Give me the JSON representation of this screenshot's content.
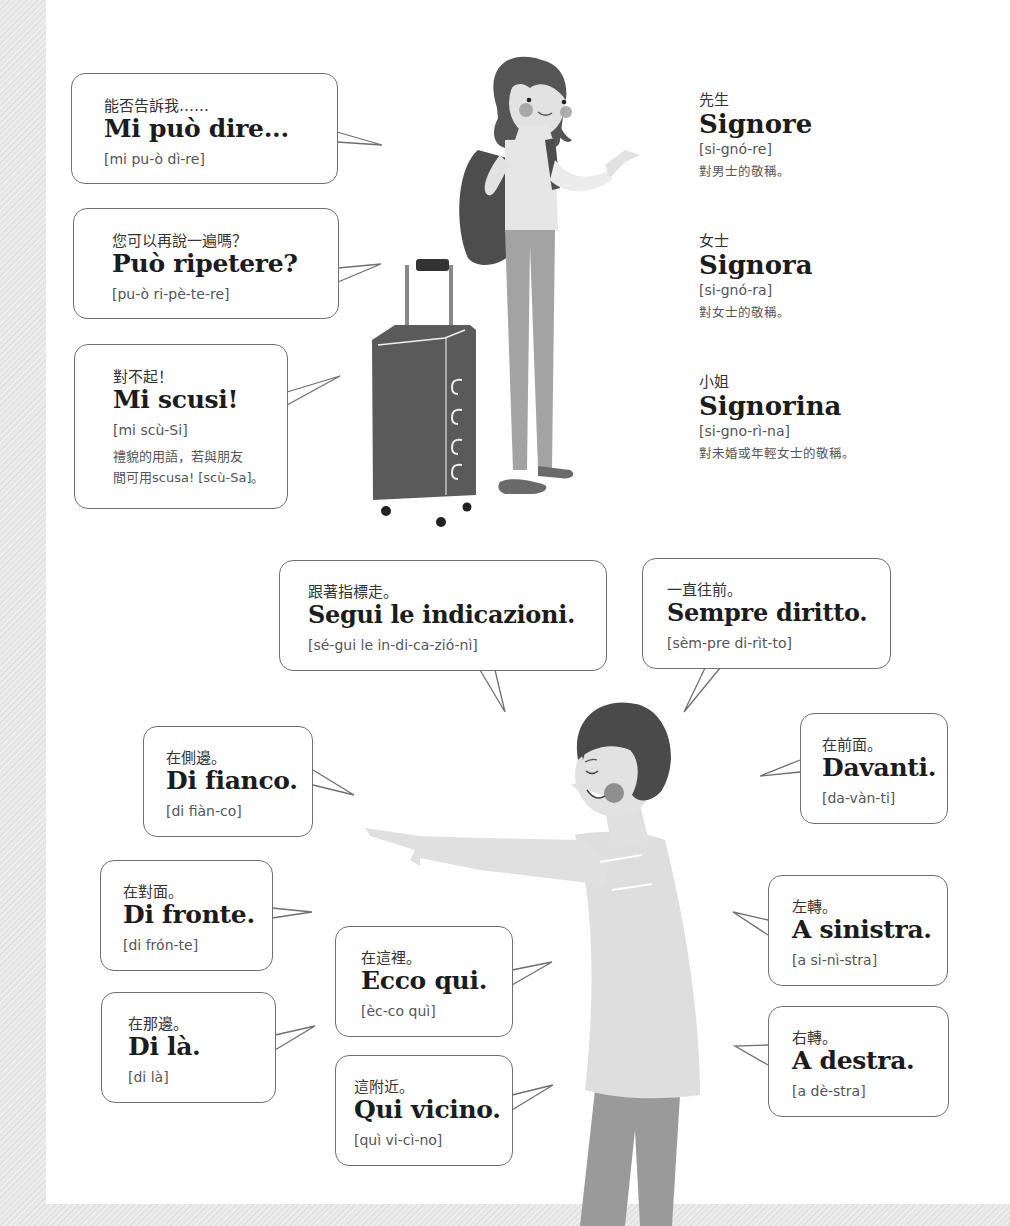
{
  "colors": {
    "background_stripe": "#e6e6e6",
    "page": "#ffffff",
    "bubble_border": "#6f6f6f",
    "text_dark": "#1c1c1c",
    "text_muted": "#555555",
    "hair_dark": "#4a4a4a",
    "skin": "#dcdcdc",
    "pants": "#9a9a9a",
    "cheek": "#8a8a8a"
  },
  "top_bubbles": [
    {
      "zh": "能否告訴我……",
      "it": "Mi può dire...",
      "pron": "[mi pu-ò dì-re]"
    },
    {
      "zh": "您可以再說一遍嗎？",
      "it": "Può ripetere?",
      "pron": "[pu-ò ri-pè-te-re]"
    },
    {
      "zh": "對不起！",
      "it": "Mi scusi!",
      "pron": "[mi scù-Si]",
      "note1": "禮貌的用語，若與朋友",
      "note2": "間可用scusa! [scù-Sa]。"
    }
  ],
  "titles": [
    {
      "zh": "先生",
      "it": "Signore",
      "pron": "[si-gnó-re]",
      "note": "對男士的敬稱。"
    },
    {
      "zh": "女士",
      "it": "Signora",
      "pron": "[si-gnó-ra]",
      "note": "對女士的敬稱。"
    },
    {
      "zh": "小姐",
      "it": "Signorina",
      "pron": "[si-gno-rì-na]",
      "note": "對未婚或年輕女士的敬稱。"
    }
  ],
  "directions": {
    "segui": {
      "zh": "跟著指標走。",
      "it": "Segui le indicazioni.",
      "pron": "[sé-gui le in-di-ca-zió-nì]"
    },
    "sempre": {
      "zh": "一直往前。",
      "it": "Sempre diritto.",
      "pron": "[sèm-pre di-rìt-to]"
    },
    "fianco": {
      "zh": "在側邊。",
      "it": "Di fianco.",
      "pron": "[di fiàn-co]"
    },
    "davanti": {
      "zh": "在前面。",
      "it": "Davanti.",
      "pron": "[da-vàn-ti]"
    },
    "fronte": {
      "zh": "在對面。",
      "it": "Di fronte.",
      "pron": "[di frón-te]"
    },
    "sinistra": {
      "zh": "左轉。",
      "it": "A sinistra.",
      "pron": "[a si-nì-stra]"
    },
    "ecco": {
      "zh": "在這裡。",
      "it": "Ecco qui.",
      "pron": "[èc-co quì]"
    },
    "la": {
      "zh": "在那邊。",
      "it": "Di là.",
      "pron": "[di là]"
    },
    "destra": {
      "zh": "右轉。",
      "it": "A destra.",
      "pron": "[a dè-stra]"
    },
    "vicino": {
      "zh": "這附近。",
      "it": "Qui vicino.",
      "pron": "[quì vi-cì-no]"
    }
  },
  "illustrations": {
    "traveler": "woman-with-backpack-and-suitcase",
    "guide": "man-pointing-left"
  }
}
